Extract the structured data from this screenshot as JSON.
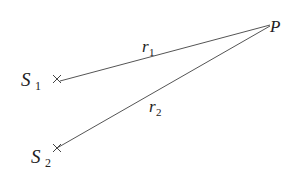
{
  "diagram": {
    "points": {
      "P": {
        "label": "P"
      },
      "S1": {
        "label": "S",
        "subscript": "1"
      },
      "S2": {
        "label": "S",
        "subscript": "2"
      }
    },
    "segments": [
      {
        "from": "S1",
        "to": "P",
        "label": "r",
        "subscript": "1"
      },
      {
        "from": "S2",
        "to": "P",
        "label": "r",
        "subscript": "2"
      }
    ],
    "colors": {
      "line": "#555555",
      "text": "#222222",
      "background": "#ffffff"
    }
  }
}
